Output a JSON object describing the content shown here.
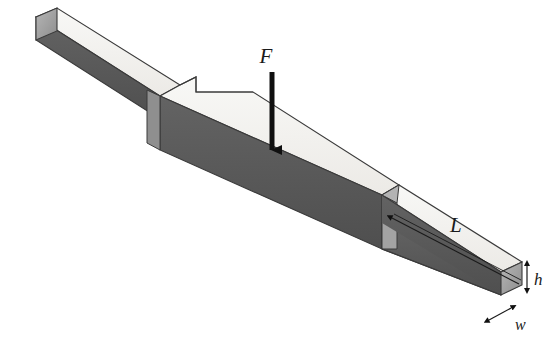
{
  "figure": {
    "type": "isometric-technical-diagram",
    "background_color": "#ffffff"
  },
  "colors": {
    "top_face": "#f4f4f1",
    "top_face_shade": "#eceae6",
    "front_face_dark": "#585858",
    "front_face_mid": "#6a6a6a",
    "end_face": "#9a9a9a",
    "step_face": "#9d9d9d",
    "outline": "#3a3a3a",
    "label_color": "#1a1a1a",
    "arrow_color": "#101010"
  },
  "labels": {
    "force": "F",
    "length": "L",
    "height": "h",
    "width": "w"
  },
  "annotations": [
    {
      "name": "force-arrow",
      "label": "F",
      "direction": "down",
      "points_at": "center of thick block top face"
    },
    {
      "name": "length-dimension",
      "label": "L",
      "measures": "thin beam segment from step to right end"
    },
    {
      "name": "height-dimension",
      "label": "h",
      "measures": "beam cross-section height at right end"
    },
    {
      "name": "width-dimension",
      "label": "w",
      "measures": "beam cross-section width at right end"
    }
  ],
  "geometry": {
    "description": "Slender rectangular beam oriented from upper-left to lower-right in isometric view, with an enlarged rectangular block in the middle section. Steps occur at both ends of the central block.",
    "segments": [
      "left thin beam",
      "central thick block",
      "right thin beam"
    ]
  }
}
